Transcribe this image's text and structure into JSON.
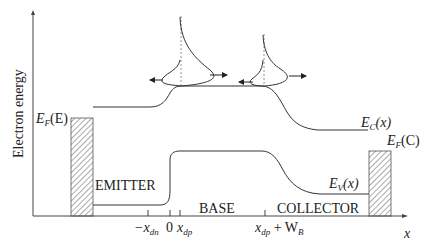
{
  "diagram": {
    "type": "band-diagram",
    "y_axis_label": "Electron energy",
    "x_axis_label": "x",
    "regions": {
      "emitter": "EMITTER",
      "base": "BASE",
      "collector": "COLLECTOR"
    },
    "band_labels": {
      "conduction": {
        "main": "E",
        "sub": "C",
        "arg": "(x)"
      },
      "valence": {
        "main": "E",
        "sub": "V",
        "arg": "(x)"
      },
      "fermi_emitter": {
        "main": "E",
        "sub": "F",
        "arg": "(E)"
      },
      "fermi_collector": {
        "main": "E",
        "sub": "F",
        "arg": "(C)"
      }
    },
    "x_ticks": [
      {
        "id": "neg_xdn",
        "pre": "−x",
        "sub": "dn",
        "post": ""
      },
      {
        "id": "zero",
        "pre": "0",
        "sub": "",
        "post": ""
      },
      {
        "id": "xdp",
        "pre": "x",
        "sub": "dp",
        "post": ""
      },
      {
        "id": "xdp_wb",
        "pre": "x",
        "sub": "dp",
        "post": " + W",
        "sub2": "B"
      }
    ],
    "colors": {
      "line": "#333333",
      "hatch": "#555555",
      "axis": "#444444"
    }
  }
}
